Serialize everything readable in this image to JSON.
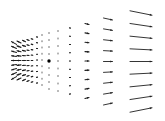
{
  "chart_data": {
    "type": "quiver",
    "title": "",
    "xlabel": "",
    "ylabel": "",
    "grid": false,
    "legend": null,
    "arrow_color": "#1e1e1e",
    "center_marker": {
      "x": 49,
      "y": 61,
      "size": 3,
      "color": "#000000"
    },
    "rows_per_column": 9,
    "columns": [
      {
        "x": 14,
        "y_top": 43,
        "y_bottom": 78,
        "dx": -5.0,
        "fan": 0.55
      },
      {
        "x": 19,
        "y_top": 42,
        "y_bottom": 79,
        "dx": -4.0,
        "fan": 0.5
      },
      {
        "x": 24,
        "y_top": 41,
        "y_bottom": 80,
        "dx": -3.0,
        "fan": 0.45
      },
      {
        "x": 28,
        "y_top": 40,
        "y_bottom": 81,
        "dx": -2.2,
        "fan": 0.45
      },
      {
        "x": 32,
        "y_top": 39,
        "y_bottom": 82,
        "dx": -1.6,
        "fan": 0.4
      },
      {
        "x": 37,
        "y_top": 37,
        "y_bottom": 83,
        "dx": -1.0,
        "fan": 0.3
      },
      {
        "x": 42,
        "y_top": 35,
        "y_bottom": 85,
        "dx": -0.5,
        "fan": 0.2
      },
      {
        "x": 49,
        "y_top": 33,
        "y_bottom": 89,
        "dx": 0.0,
        "fan": 0.0
      },
      {
        "x": 58,
        "y_top": 31,
        "y_bottom": 91,
        "dx": 0.3,
        "fan": 0.0
      },
      {
        "x": 70,
        "y_top": 28,
        "y_bottom": 94,
        "dx": 1.0,
        "fan": 0.2
      },
      {
        "x": 87,
        "y_top": 24,
        "y_bottom": 98,
        "dx": 4.0,
        "fan": 0.25
      },
      {
        "x": 108,
        "y_top": 19,
        "y_bottom": 104,
        "dx": 9.0,
        "fan": 0.22
      },
      {
        "x": 141,
        "y_top": 13,
        "y_bottom": 110,
        "dx": 22.0,
        "fan": 0.2
      }
    ]
  }
}
